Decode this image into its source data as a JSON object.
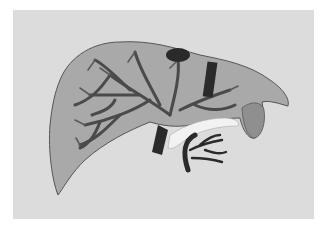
{
  "image": {
    "subject": "3D rendering of liver with vascular tree",
    "background_color": "#ffffff",
    "panel_color": "#dcdcdc",
    "liver_fill": "#a9a9a9",
    "vessel_color": "#4a4a4a",
    "dark_vessel_color": "#2a2a2a",
    "light_vessel_color": "#f2f2f2"
  }
}
